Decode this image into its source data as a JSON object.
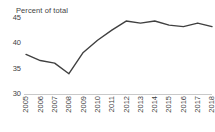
{
  "chart_data": {
    "type": "line",
    "title": "Percent of total",
    "xlabel": "",
    "ylabel": "",
    "ylim": [
      30,
      45
    ],
    "yticks": [
      30,
      35,
      40,
      45
    ],
    "grid": false,
    "legend": null,
    "line_color": "#404040",
    "axis_color": "#c9c9c9",
    "categories": [
      "2005",
      "2006",
      "2007",
      "2008",
      "2009",
      "2010",
      "2011",
      "2012",
      "2013",
      "2014",
      "2015",
      "2016",
      "2017",
      "2018"
    ],
    "x": [
      2005,
      2006,
      2007,
      2008,
      2009,
      2010,
      2011,
      2012,
      2013,
      2014,
      2015,
      2016,
      2017,
      2018
    ],
    "values": [
      37.8,
      36.6,
      36.1,
      34.0,
      38.2,
      40.6,
      42.6,
      44.4,
      44.0,
      44.4,
      43.6,
      43.3,
      44.0,
      43.3
    ],
    "series": [
      {
        "name": "Percent of total",
        "values": [
          37.8,
          36.6,
          36.1,
          34.0,
          38.2,
          40.6,
          42.6,
          44.4,
          44.0,
          44.4,
          43.6,
          43.3,
          44.0,
          43.3
        ]
      }
    ]
  }
}
